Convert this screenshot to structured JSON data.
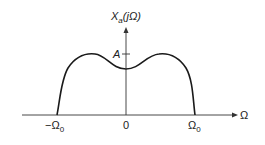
{
  "diagram": {
    "y_axis_label": "X",
    "y_axis_label_sub": "a",
    "y_axis_label_arg": "(jΩ)",
    "x_axis_label": "Ω",
    "amplitude_label": "A",
    "ticks": {
      "neg_cutoff": "−Ω",
      "neg_cutoff_sub": "0",
      "origin": "0",
      "pos_cutoff": "Ω",
      "pos_cutoff_sub": "0"
    },
    "colors": {
      "curve": "#1a1a1a",
      "axis": "#333333"
    }
  }
}
